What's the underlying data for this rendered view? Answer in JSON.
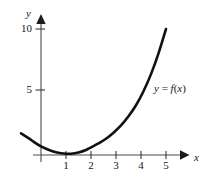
{
  "figure": {
    "background_color": "#ffffff",
    "ink_color": "#161616",
    "axis_color": "#4a4a4a",
    "width": 210,
    "height": 184
  },
  "chart_data": {
    "type": "line",
    "title": "",
    "subtitle": "",
    "xlabel": "x",
    "ylabel": "y",
    "xlim": [
      -0.85,
      5.9
    ],
    "ylim": [
      -0.5,
      11.2
    ],
    "xticks": [
      1,
      2,
      3,
      4,
      5
    ],
    "xtick_labels": [
      "1",
      "2",
      "3",
      "4",
      "5"
    ],
    "yticks": [
      5,
      10
    ],
    "ytick_labels": [
      "5",
      "10"
    ],
    "grid": false,
    "legend_position": "none",
    "annotations": [
      {
        "text": "y = f(x)",
        "text_parts": {
          "lhs": "y",
          "equals": "=",
          "rhs_fn": "f",
          "rhs_open": "(",
          "rhs_var": "x",
          "rhs_close": ")"
        },
        "x": 4.55,
        "y": 5.6,
        "style": "italic"
      }
    ],
    "series": [
      {
        "name": "f(x)",
        "color": "#111111",
        "linewidth": 2.6,
        "x": [
          -0.8,
          -0.5,
          -0.2,
          0.0,
          0.3,
          0.6,
          0.9,
          1.2,
          1.5,
          1.8,
          2.0,
          2.3,
          2.6,
          2.9,
          3.2,
          3.5,
          3.8,
          4.1,
          4.4,
          4.7,
          5.0
        ],
        "y": [
          1.45,
          1.05,
          0.62,
          0.38,
          0.1,
          -0.1,
          -0.2,
          -0.22,
          -0.12,
          0.08,
          0.3,
          0.62,
          1.0,
          1.5,
          2.1,
          2.85,
          3.75,
          4.9,
          6.3,
          8.0,
          10.0
        ]
      }
    ]
  },
  "axes": {
    "y_axis_name": "y",
    "x_axis_name": "x",
    "y_tick_10": "10",
    "y_tick_5": "5",
    "x_tick_1": "1",
    "x_tick_2": "2",
    "x_tick_3": "3",
    "x_tick_4": "4",
    "x_tick_5": "5",
    "y_arrow": "up-arrow-icon",
    "x_arrow": "right-arrow-icon"
  },
  "annotation": {
    "lhs": "y",
    "equals": " = ",
    "fn": "f",
    "open_paren": "(",
    "var": "x",
    "close_paren": ")"
  }
}
